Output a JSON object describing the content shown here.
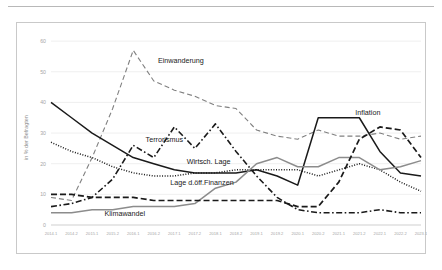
{
  "chart_data": {
    "type": "line",
    "title": "",
    "xlabel": "",
    "ylabel": "in % der Befragten",
    "ylim": [
      0,
      62
    ],
    "yticks": [
      0,
      10,
      20,
      30,
      40,
      50,
      60
    ],
    "grid": true,
    "legend_position": "inline-labels",
    "categories": [
      "2014.1",
      "2014.2",
      "2015.1",
      "2015.2",
      "2016.1",
      "2016.2",
      "2017.1",
      "2017.2",
      "2018.1",
      "2018.2",
      "2019.1",
      "2019.2",
      "2020.1",
      "2020.2",
      "2021.1",
      "2021.2",
      "2022.1",
      "2022.2",
      "2023.1"
    ],
    "series": [
      {
        "name": "Einwanderung",
        "style": "dashed",
        "color": "#808080",
        "label_x": 2016.6,
        "label_y": 53,
        "values": [
          9,
          8,
          22,
          38,
          57,
          47,
          44,
          42,
          39,
          38,
          31,
          29,
          28,
          31,
          29,
          29,
          30,
          28,
          29
        ]
      },
      {
        "name": "Terrorismus",
        "style": "dashdot",
        "color": "#1a1a1a",
        "label_x": 2016.3,
        "label_y": 27,
        "values": [
          6,
          7,
          9,
          15,
          26,
          22,
          32,
          25,
          33,
          24,
          16,
          9,
          5,
          4,
          4,
          4,
          5,
          4,
          4
        ]
      },
      {
        "name": "Wirtsch. Lage",
        "style": "solid",
        "color": "#1a1a1a",
        "label_x": 2017.3,
        "label_y": 20,
        "values": [
          40,
          35,
          30,
          26,
          22,
          20,
          18,
          17,
          17,
          17,
          18,
          16,
          13,
          35,
          35,
          35,
          24,
          17,
          16
        ]
      },
      {
        "name": "Lage d.öff.Finanzen",
        "style": "dotted",
        "color": "#1a1a1a",
        "label_x": 2016.9,
        "label_y": 13,
        "values": [
          27,
          24,
          22,
          19,
          17,
          16,
          16,
          17,
          17,
          18,
          18,
          18,
          18,
          16,
          18,
          20,
          18,
          14,
          11
        ]
      },
      {
        "name": "Klimawandel",
        "style": "solid",
        "color": "#8c8c8c",
        "label_x": 2015.3,
        "label_y": 3,
        "values": [
          4,
          4,
          5,
          5,
          6,
          6,
          6,
          7,
          12,
          14,
          20,
          22,
          19,
          19,
          22,
          22,
          18,
          19,
          21
        ]
      },
      {
        "name": "Inflation",
        "style": "dashed-bold",
        "color": "#1a1a1a",
        "label_x": 2021.4,
        "label_y": 36,
        "values": [
          10,
          10,
          9,
          9,
          9,
          8,
          8,
          8,
          8,
          8,
          8,
          8,
          6,
          6,
          14,
          28,
          32,
          31,
          22
        ]
      }
    ]
  }
}
